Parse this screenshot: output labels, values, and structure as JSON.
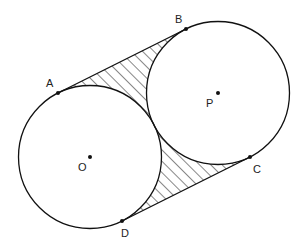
{
  "diagram": {
    "circles": [
      {
        "name": "O",
        "cx": 90,
        "cy": 157,
        "r": 71.5
      },
      {
        "name": "P",
        "cx": 218,
        "cy": 93,
        "r": 71.5
      }
    ],
    "points": {
      "A": {
        "label": "A",
        "x": 58,
        "y": 93,
        "lx": 46,
        "ly": 87
      },
      "B": {
        "label": "B",
        "x": 186,
        "y": 29,
        "lx": 175,
        "ly": 23
      },
      "C": {
        "label": "C",
        "x": 250,
        "y": 157,
        "lx": 253,
        "ly": 173
      },
      "D": {
        "label": "D",
        "x": 122,
        "y": 221,
        "lx": 121,
        "ly": 237
      },
      "O": {
        "label": "O",
        "x": 90,
        "y": 157,
        "lx": 78,
        "ly": 171
      },
      "P": {
        "label": "P",
        "x": 218,
        "y": 93,
        "lx": 206,
        "ly": 107
      }
    },
    "stroke_color": "#111111",
    "hatch": "diagonal"
  }
}
